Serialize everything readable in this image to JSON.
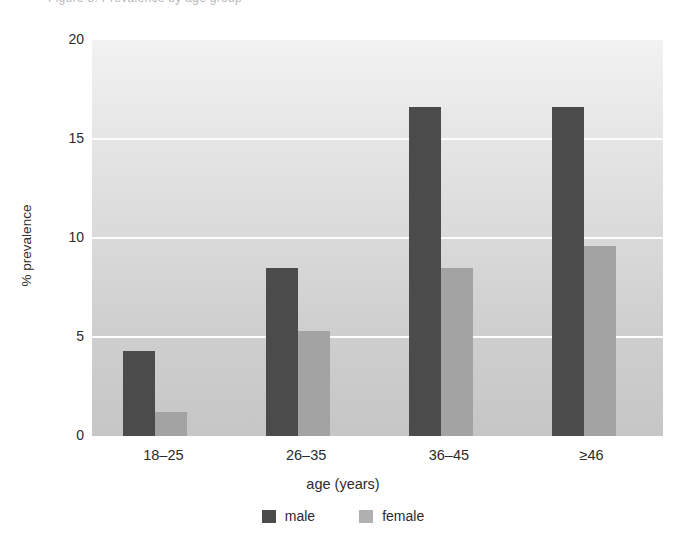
{
  "clipped_caption": "Figure 3. Prevalence by age group",
  "chart_data": {
    "type": "bar",
    "title": "",
    "xlabel": "age (years)",
    "ylabel": "% prevalence",
    "categories": [
      "18–25",
      "26–35",
      "36–45",
      "≥46"
    ],
    "series": [
      {
        "name": "male",
        "color": "#4b4b4b",
        "values": [
          4.3,
          8.5,
          16.6,
          16.6
        ]
      },
      {
        "name": "female",
        "color": "#a3a3a3",
        "values": [
          1.2,
          5.3,
          8.5,
          9.6
        ]
      }
    ],
    "ylim": [
      0,
      20
    ],
    "yticks": [
      0,
      5,
      10,
      15,
      20
    ],
    "ytick_labels": [
      "0",
      "5",
      "10",
      "15",
      "20"
    ],
    "grid": "horizontal-white",
    "legend_position": "bottom-center",
    "plot_background": "gray-gradient"
  },
  "legend": {
    "items": [
      {
        "label": "male"
      },
      {
        "label": "female"
      }
    ]
  }
}
